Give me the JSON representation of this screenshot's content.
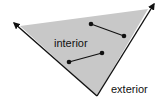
{
  "diagram": {
    "labels": {
      "interior": "interior",
      "exterior": "exterior"
    },
    "colors": {
      "fill": "#c8c8c8",
      "stroke": "#111111",
      "background": "#ffffff"
    },
    "vertex": [
      97,
      96
    ],
    "rays": [
      {
        "name": "left-ray",
        "tip": [
          13,
          22
        ]
      },
      {
        "name": "right-ray",
        "tip": [
          155,
          3
        ]
      }
    ],
    "segments": [
      {
        "name": "segment-upper",
        "from": [
          91,
          24
        ],
        "to": [
          124,
          36
        ]
      },
      {
        "name": "segment-lower",
        "from": [
          69,
          62
        ],
        "to": [
          102,
          53
        ]
      }
    ]
  }
}
